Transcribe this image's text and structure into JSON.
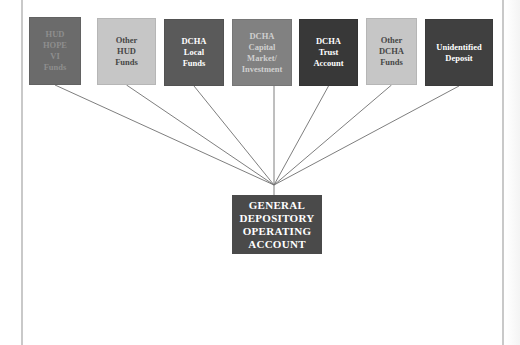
{
  "diagram": {
    "type": "fund-flow",
    "sources": [
      {
        "id": "hud-hope-vi",
        "label": "HUD\nHOPE\nVI\nFunds",
        "fill": "#6b6b6b",
        "text_color": "#8e8e8e",
        "x": 29,
        "y": 17,
        "w": 52,
        "h": 68
      },
      {
        "id": "other-hud",
        "label": "Other\nHUD\nFunds",
        "fill": "#c6c6c6",
        "text_color": "#474747",
        "x": 97,
        "y": 18,
        "w": 59,
        "h": 67
      },
      {
        "id": "dcha-local",
        "label": "DCHA\nLocal\nFunds",
        "fill": "#5a5a5a",
        "text_color": "#ffffff",
        "x": 164,
        "y": 19,
        "w": 60,
        "h": 67
      },
      {
        "id": "dcha-capital",
        "label": "DCHA\nCapital\nMarket/\nInvestment",
        "fill": "#818181",
        "text_color": "#cfcfcf",
        "x": 232,
        "y": 19,
        "w": 60,
        "h": 67
      },
      {
        "id": "dcha-trust",
        "label": "DCHA\nTrust\nAccount",
        "fill": "#383838",
        "text_color": "#ffffff",
        "x": 299,
        "y": 19,
        "w": 59,
        "h": 67
      },
      {
        "id": "other-dcha",
        "label": "Other\nDCHA\nFunds",
        "fill": "#c6c6c6",
        "text_color": "#474747",
        "x": 366,
        "y": 18,
        "w": 51,
        "h": 67
      },
      {
        "id": "unidentified",
        "label": "Unidentified\nDeposit",
        "fill": "#404040",
        "text_color": "#ffffff",
        "x": 425,
        "y": 19,
        "w": 68,
        "h": 67
      }
    ],
    "target": {
      "id": "general-depository",
      "label": "GENERAL\nDEPOSITORY\nOPERATING\nACCOUNT",
      "fill": "#4a4a4a",
      "text_color": "#ffffff",
      "x": 232,
      "y": 195,
      "w": 90,
      "h": 59
    },
    "convergence_point": {
      "x": 274,
      "y": 185
    },
    "line_color": "#6f6f6f"
  }
}
